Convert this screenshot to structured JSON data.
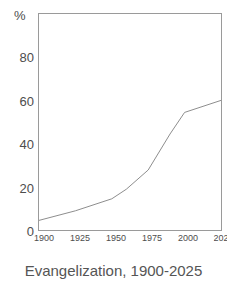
{
  "caption": "Evangelization, 1900-2025",
  "axes": {
    "unit_label": "%",
    "y_ticks": [
      "80",
      "60",
      "40",
      "20",
      "0"
    ],
    "x_ticks": [
      "1900",
      "1925",
      "1950",
      "1975",
      "2000",
      "202"
    ]
  },
  "colors": {
    "line": "#8c8c8c",
    "frame": "#9a9a9a",
    "text": "#4d4d4d",
    "caption": "#555555",
    "background": "#ffffff"
  },
  "chart_data": {
    "type": "line",
    "title": "Evangelization, 1900-2025",
    "xlabel": "",
    "ylabel": "%",
    "xlim": [
      1900,
      2025
    ],
    "ylim": [
      0,
      90
    ],
    "grid": false,
    "legend": false,
    "x_tick_values": [
      1900,
      1925,
      1950,
      1975,
      2000,
      2025
    ],
    "y_tick_values": [
      0,
      20,
      40,
      60,
      80
    ],
    "series": [
      {
        "name": "Evangelization",
        "x": [
          1900,
          1925,
          1950,
          1960,
          1975,
          1990,
          2000,
          2025
        ],
        "values": [
          4,
          8,
          13,
          17,
          25,
          40,
          49,
          54
        ]
      }
    ]
  }
}
